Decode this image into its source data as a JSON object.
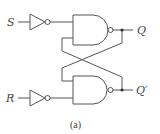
{
  "diagram": {
    "caption": "(a)",
    "inputs": [
      {
        "name": "S"
      },
      {
        "name": "R"
      }
    ],
    "outputs": [
      {
        "name": "Q"
      },
      {
        "name": "Q′"
      }
    ],
    "components": [
      "inverter-S",
      "inverter-R",
      "nand-top",
      "nand-bottom"
    ],
    "line_color": "#555555"
  }
}
